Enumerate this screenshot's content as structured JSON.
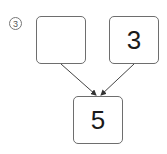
{
  "problem": {
    "number_label": "3",
    "boxes": {
      "top_left": "",
      "top_right": "3",
      "bottom": "5"
    }
  }
}
